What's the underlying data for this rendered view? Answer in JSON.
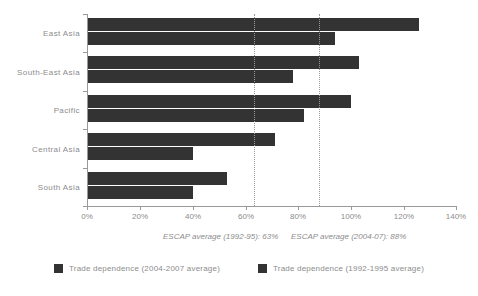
{
  "chart_data": {
    "type": "bar",
    "orientation": "horizontal",
    "title": "",
    "xlabel": "",
    "ylabel": "",
    "categories": [
      "East Asia",
      "South-East Asia",
      "Pacific",
      "Central Asia",
      "South Asia"
    ],
    "series": [
      {
        "name": "Trade dependence (2004-2007 average)",
        "color": "#333333",
        "values": [
          126,
          103,
          100,
          71,
          53
        ]
      },
      {
        "name": "Trade dependence (1992-1995 average)",
        "color": "#333333",
        "values": [
          94,
          78,
          82,
          40,
          40
        ]
      }
    ],
    "xlim": [
      0,
      140
    ],
    "xticks": [
      0,
      20,
      40,
      60,
      80,
      100,
      120,
      140
    ],
    "xtick_labels": [
      "0%",
      "20%",
      "40%",
      "60%",
      "80%",
      "100%",
      "120%",
      "140%"
    ],
    "grid": false,
    "legend_position": "bottom",
    "reference_lines": [
      {
        "value": 63,
        "label": "ESCAP average (1992-95): 63%"
      },
      {
        "value": 88,
        "label": "ESCAP average (2004-07): 88%"
      }
    ],
    "annotations": [
      {
        "text": "ESCAP average (1992-95): 63%"
      },
      {
        "text": "ESCAP average (2004-07): 88%"
      }
    ]
  },
  "axis": {
    "tick_0": "0%",
    "tick_1": "20%",
    "tick_2": "40%",
    "tick_3": "60%",
    "tick_4": "80%",
    "tick_5": "100%",
    "tick_6": "120%",
    "tick_7": "140%"
  },
  "categories": {
    "c0": "East Asia",
    "c1": "South-East Asia",
    "c2": "Pacific",
    "c3": "Central Asia",
    "c4": "South Asia"
  },
  "annotations": {
    "a0": "ESCAP average (1992-95): 63%",
    "a1": "ESCAP average (2004-07): 88%"
  },
  "legend": {
    "item0": "Trade dependence (2004-2007 average)",
    "item1": "Trade dependence (1992-1995 average)"
  }
}
